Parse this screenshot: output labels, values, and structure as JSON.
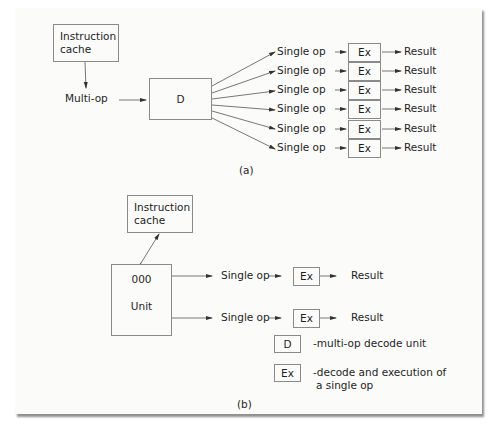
{
  "diagram_a": {
    "caption": "(a)",
    "instruction_cache": "Instruction cache",
    "instruction_cache_line1": "Instruction",
    "instruction_cache_line2": "cache",
    "multi_op": "Multi-op",
    "decode_unit": "D",
    "rows": [
      {
        "op": "Single op",
        "unit": "Ex",
        "result": "Result"
      },
      {
        "op": "Single op",
        "unit": "Ex",
        "result": "Result"
      },
      {
        "op": "Single op",
        "unit": "Ex",
        "result": "Result"
      },
      {
        "op": "Single op",
        "unit": "Ex",
        "result": "Result"
      },
      {
        "op": "Single op",
        "unit": "Ex",
        "result": "Result"
      },
      {
        "op": "Single op",
        "unit": "Ex",
        "result": "Result"
      }
    ]
  },
  "diagram_b": {
    "caption": "(b)",
    "instruction_cache_line1": "Instruction",
    "instruction_cache_line2": "cache",
    "ooo_unit_line1": "000",
    "ooo_unit_line2": "Unit",
    "rows": [
      {
        "op": "Single op",
        "unit": "Ex",
        "result": "Result"
      },
      {
        "op": "Single op",
        "unit": "Ex",
        "result": "Result"
      }
    ]
  },
  "legend": {
    "items": [
      {
        "symbol": "D",
        "description": "-multi-op decode unit"
      },
      {
        "symbol": "Ex",
        "description_line1": "-decode and execution of",
        "description_line2": "a single op"
      }
    ]
  },
  "colors": {
    "line": "#555555",
    "box_border": "#8a8a8a",
    "text": "#1e1e1e",
    "paper": "#fbfbfa"
  }
}
